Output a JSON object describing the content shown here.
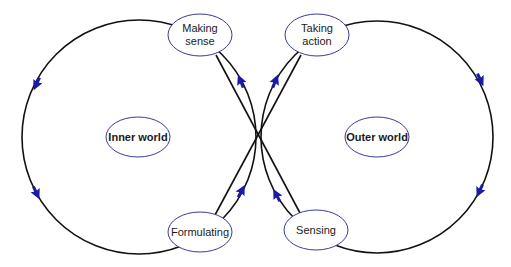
{
  "diagram": {
    "type": "figure-eight-loop",
    "colors": {
      "loop_stroke": "#111111",
      "node_stroke": "#3a3a9a",
      "arrow_fill": "#1a1aa6",
      "background": "#ffffff"
    },
    "loops": [
      {
        "id": "inner",
        "center_label": "Inner world"
      },
      {
        "id": "outer",
        "center_label": "Outer world"
      }
    ],
    "nodes": {
      "making_sense": {
        "line1": "Making",
        "line2": "sense"
      },
      "taking_action": {
        "line1": "Taking",
        "line2": "action"
      },
      "formulating": {
        "label": "Formulating"
      },
      "sensing": {
        "label": "Sensing"
      },
      "inner_world": {
        "label": "Inner world"
      },
      "outer_world": {
        "label": "Outer world"
      }
    },
    "flow": [
      "Sensing → Making sense",
      "Making sense → Inner world loop (counter-clockwise) → Formulating",
      "Formulating → Taking action",
      "Taking action → Outer world loop (clockwise) → Sensing"
    ]
  }
}
